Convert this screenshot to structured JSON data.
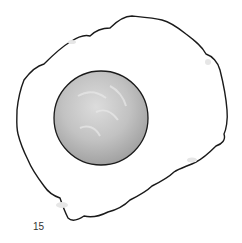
{
  "illustration": {
    "subject": "fried egg",
    "colors": {
      "outline": "#1a1a1a",
      "white": "#ffffff",
      "yolk_light": "#d4d4d4",
      "yolk_dark": "#a8a8a8",
      "shadow": "#cfcfcf"
    }
  },
  "page_number": "15"
}
